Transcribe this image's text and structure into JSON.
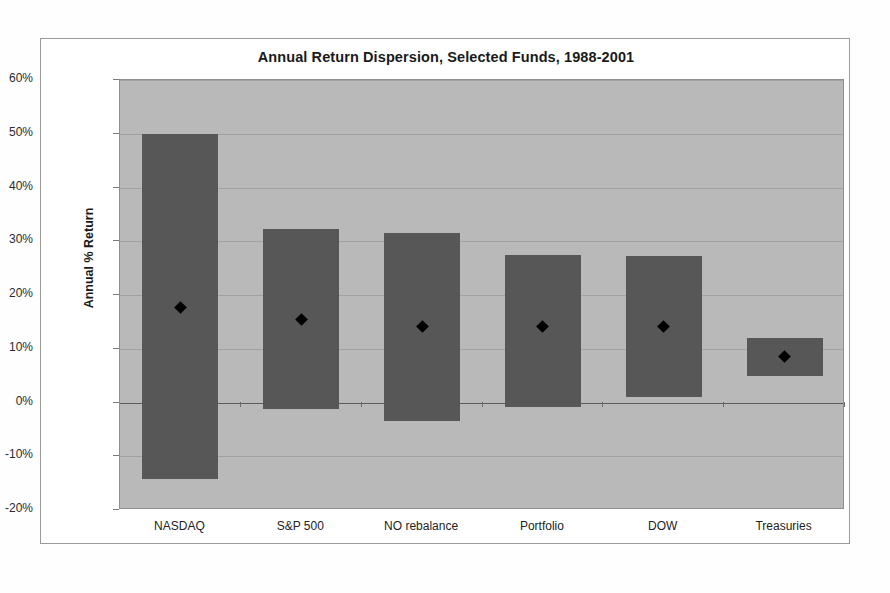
{
  "chart_data": {
    "type": "bar",
    "title": "Annual Return Dispersion, Selected Funds, 1988-2001",
    "xlabel": "",
    "ylabel": "Annual % Return",
    "categories": [
      "NASDAQ",
      "S&P 500",
      "NO rebalance",
      "Portfolio",
      "DOW",
      "Treasuries"
    ],
    "ylim": [
      -20,
      60
    ],
    "ytick_values": [
      60,
      50,
      40,
      30,
      20,
      10,
      0,
      -10,
      -20
    ],
    "ytick_labels": [
      "60%",
      "50%",
      "40%",
      "30%",
      "20%",
      "10%",
      "0%",
      "-10%",
      "-20%"
    ],
    "grid": true,
    "legend": null,
    "series": [
      {
        "name": "Dispersion range (high)",
        "values": [
          50.0,
          32.2,
          31.6,
          27.4,
          27.2,
          12.0
        ]
      },
      {
        "name": "Dispersion range (low)",
        "values": [
          -14.2,
          -1.3,
          -3.4,
          -0.9,
          1.1,
          5.0
        ]
      },
      {
        "name": "Average annual return",
        "values": [
          17.7,
          15.4,
          14.1,
          14.2,
          14.1,
          8.6
        ]
      }
    ],
    "bars": [
      {
        "category": "NASDAQ",
        "high": 50.0,
        "low": -14.2,
        "mean": 17.7
      },
      {
        "category": "S&P 500",
        "high": 32.2,
        "low": -1.3,
        "mean": 15.4
      },
      {
        "category": "NO rebalance",
        "high": 31.6,
        "low": -3.4,
        "mean": 14.1
      },
      {
        "category": "Portfolio",
        "high": 27.4,
        "low": -0.9,
        "mean": 14.2
      },
      {
        "category": "DOW",
        "high": 27.2,
        "low": 1.1,
        "mean": 14.1
      },
      {
        "category": "Treasuries",
        "high": 12.0,
        "low": 5.0,
        "mean": 8.6
      }
    ],
    "colors": {
      "bar": "#575757",
      "marker": "#000000",
      "plot_background": "#b9b9b9",
      "gridline": "#a2a2a2",
      "figure_background": "#ffffff",
      "text": "#1a1a1a"
    }
  }
}
